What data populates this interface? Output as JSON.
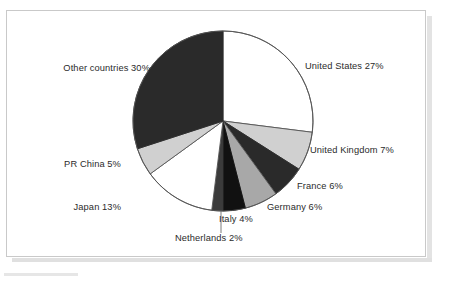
{
  "document": {
    "background_color": "#ffffff",
    "card_border_color": "#c9c9c9",
    "shadow_color": "#e3e3e3"
  },
  "chart_data": {
    "type": "pie",
    "title": "",
    "subtitle": "",
    "xlabel": "",
    "ylabel": "",
    "legend_position": "none",
    "grid": false,
    "labels_show_percent": true,
    "start_angle_deg": 0,
    "direction": "clockwise",
    "categories": [
      "United States",
      "United Kingdom",
      "France",
      "Germany",
      "Italy",
      "Netherlands",
      "Japan",
      "PR China",
      "Other countries"
    ],
    "values": [
      27,
      7,
      6,
      6,
      4,
      2,
      13,
      5,
      30
    ],
    "units": "percent",
    "total": 100,
    "slices": [
      {
        "name": "United States",
        "value": 27,
        "label": "United States 27%",
        "fill": "#ffffff",
        "stroke": "#555555",
        "label_side": "right"
      },
      {
        "name": "United Kingdom",
        "value": 7,
        "label": "United Kingdom 7%",
        "fill": "#d0d0d0",
        "stroke": "#555555",
        "label_side": "right"
      },
      {
        "name": "France",
        "value": 6,
        "label": "France 6%",
        "fill": "#2a2a2a",
        "stroke": "#2a2a2a",
        "label_side": "right"
      },
      {
        "name": "Germany",
        "value": 6,
        "label": "Germany 6%",
        "fill": "#a8a8a8",
        "stroke": "#555555",
        "label_side": "right"
      },
      {
        "name": "Italy",
        "value": 4,
        "label": "Italy 4%",
        "fill": "#111111",
        "stroke": "#111111",
        "label_side": "right"
      },
      {
        "name": "Netherlands",
        "value": 2,
        "label": "Netherlands 2%",
        "fill": "#3b3b3b",
        "stroke": "#3b3b3b",
        "label_side": "bottom",
        "has_leader_line": true
      },
      {
        "name": "Japan",
        "value": 13,
        "label": "Japan 13%",
        "fill": "#ffffff",
        "stroke": "#555555",
        "label_side": "left"
      },
      {
        "name": "PR China",
        "value": 5,
        "label": "PR China 5%",
        "fill": "#d0d0d0",
        "stroke": "#555555",
        "label_side": "left"
      },
      {
        "name": "Other countries",
        "value": 30,
        "label": "Other countries 30%",
        "fill": "#2a2a2a",
        "stroke": "#2a2a2a",
        "label_side": "left"
      }
    ]
  },
  "labels": {
    "united_states": "United States 27%",
    "united_kingdom": "United Kingdom 7%",
    "france": "France 6%",
    "germany": "Germany 6%",
    "italy": "Italy 4%",
    "netherlands": "Netherlands 2%",
    "japan": "Japan 13%",
    "pr_china": "PR China 5%",
    "other_countries": "Other countries 30%"
  }
}
